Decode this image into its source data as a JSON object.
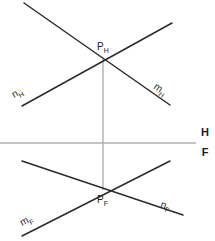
{
  "diagram": {
    "type": "descriptive-geometry",
    "width": 215,
    "height": 241,
    "colors": {
      "line_stroke": "#2b2b2b",
      "ground_line_stroke": "#8a8a8a",
      "projector_stroke": "#b0b0b0",
      "text": "#1a1a1a",
      "background": "#ffffff"
    },
    "ground_line": {
      "name": "H/F",
      "label_top": "H",
      "label_bottom": "F",
      "y": 143,
      "x_start": 0,
      "x_end": 196,
      "label_x": 205,
      "label_top_y": 136,
      "label_bottom_y": 156
    },
    "projector": {
      "name": "vertical-projector",
      "x": 103,
      "y_top": 58,
      "y_bottom": 190
    },
    "points": [
      {
        "id": "P_H",
        "letter": "P",
        "subscript": "H",
        "x": 103,
        "y": 58,
        "label_x": 97,
        "label_y": 50,
        "projection": "horizontal"
      },
      {
        "id": "P_F",
        "letter": "P",
        "subscript": "F",
        "x": 103,
        "y": 190,
        "label_x": 97,
        "label_y": 203,
        "projection": "frontal"
      }
    ],
    "lines": [
      {
        "id": "m_H",
        "letter": "m",
        "subscript": "H",
        "projection": "horizontal",
        "x1": 24,
        "y1": 3,
        "x2": 170,
        "y2": 105,
        "label_x": 153,
        "label_y": 88,
        "label_rotate": 35
      },
      {
        "id": "n_H",
        "letter": "n",
        "subscript": "H",
        "projection": "horizontal",
        "x1": 22,
        "y1": 106,
        "x2": 172,
        "y2": 23,
        "label_x": 14,
        "label_y": 98,
        "label_rotate": -29
      },
      {
        "id": "n_F",
        "letter": "n",
        "subscript": "F",
        "projection": "frontal",
        "x1": 22,
        "y1": 161,
        "x2": 183,
        "y2": 215,
        "label_x": 160,
        "label_y": 207,
        "label_rotate": 18
      },
      {
        "id": "m_F",
        "letter": "m",
        "subscript": "F",
        "projection": "frontal",
        "x1": 22,
        "y1": 236,
        "x2": 170,
        "y2": 161,
        "label_x": 22,
        "label_y": 226,
        "label_rotate": -27
      }
    ]
  }
}
